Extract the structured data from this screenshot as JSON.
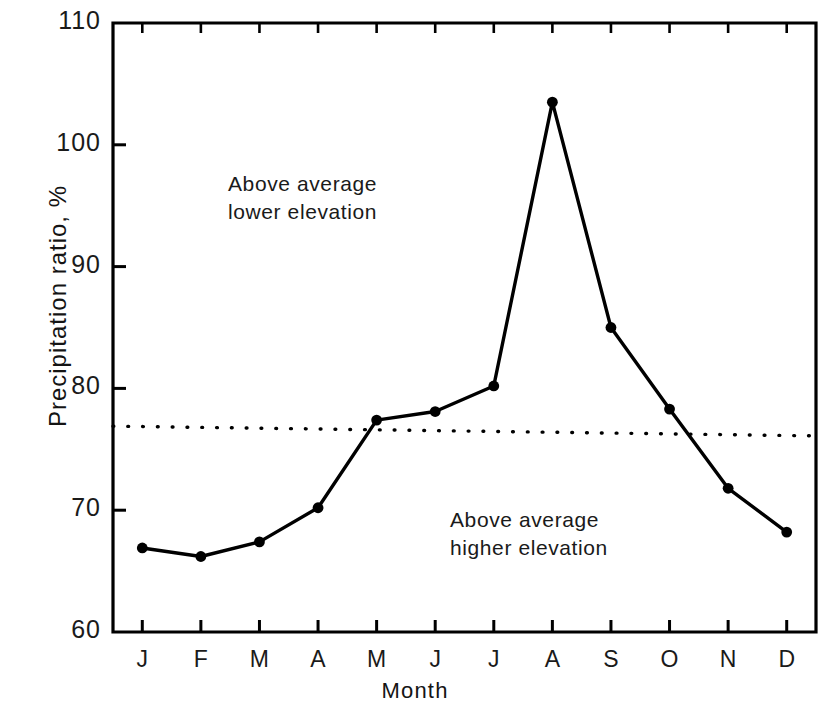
{
  "chart_data": {
    "type": "line",
    "title": "",
    "xlabel": "Month",
    "ylabel": "Precipitation ratio, %",
    "categories": [
      "J",
      "F",
      "M",
      "A",
      "M",
      "J",
      "J",
      "A",
      "S",
      "O",
      "N",
      "D"
    ],
    "category_names": [
      "January",
      "February",
      "March",
      "April",
      "May",
      "June",
      "July",
      "August",
      "September",
      "October",
      "November",
      "December"
    ],
    "values": [
      66.9,
      66.2,
      67.4,
      70.2,
      77.4,
      78.1,
      80.2,
      103.5,
      85.0,
      78.3,
      71.8,
      68.2
    ],
    "series": [
      {
        "name": "Precipitation ratio",
        "values": [
          66.9,
          66.2,
          67.4,
          70.2,
          77.4,
          78.1,
          80.2,
          103.5,
          85.0,
          78.3,
          71.8,
          68.2
        ],
        "marker": "filled-circle",
        "color": "#000000"
      }
    ],
    "reference_line": {
      "name": "average",
      "style": "dotted",
      "y_start": 76.9,
      "y_end": 76.1,
      "color": "#000000"
    },
    "ylim": [
      60,
      110
    ],
    "xlim": [
      0.5,
      12.5
    ],
    "yticks": [
      60,
      70,
      80,
      90,
      100,
      110
    ],
    "ytick_labels": [
      "60",
      "70",
      "80",
      "90",
      "100",
      "110"
    ],
    "xticks": [
      1,
      2,
      3,
      4,
      5,
      6,
      7,
      8,
      9,
      10,
      11,
      12
    ],
    "grid": false,
    "legend_position": "none",
    "annotations": [
      {
        "id": "upper",
        "line1": "Above average",
        "line2": "lower elevation",
        "x_month": 3.3,
        "y_value": 95.0
      },
      {
        "id": "lower",
        "line1": "Above average",
        "line2": "higher elevation",
        "x_month": 7.1,
        "y_value": 68.5
      }
    ],
    "frame": {
      "top": true,
      "right": true,
      "bottom": true,
      "left": true,
      "color": "#000000"
    }
  }
}
